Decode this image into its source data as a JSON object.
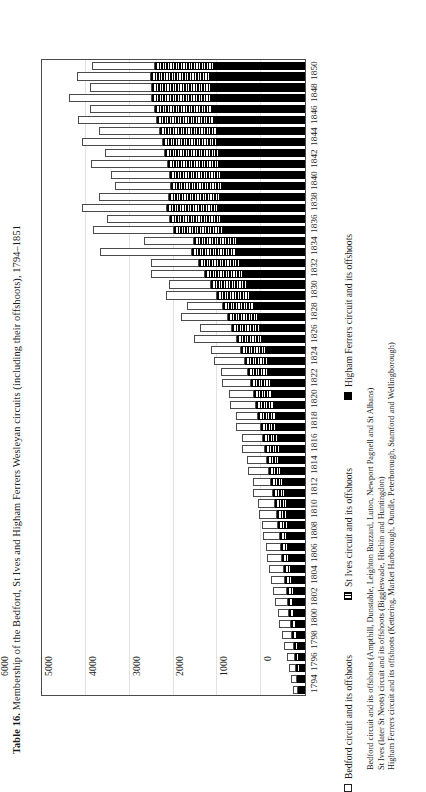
{
  "figure": {
    "table_label": "Table 16.",
    "title": "Membership of the Bedford, St Ives and Higham Ferrers Wesleyan circuits (including their offshoots), 1794–1851"
  },
  "legend": {
    "position": "right",
    "items": [
      {
        "key": "bedford",
        "swatch": "white-square",
        "label": "Bedford circuit and its offshoots"
      },
      {
        "key": "stives",
        "swatch": "hatched-square",
        "label": "St Ives circuit and its offshoots"
      },
      {
        "key": "higham",
        "swatch": "black-square",
        "label": "Higham Ferrers circuit and its offshoots"
      }
    ]
  },
  "footnotes": [
    "Bedford circuit and its offshoots (Ampthill, Dunstable, Leighton Buzzard, Luton, Newport Pagnell and St Albans)",
    "St Ives (later St Neots) circuit and its offshoots (Biggleswade, Hitchin and Huntingdon)",
    "Higham Ferrers circuit and its offshoots (Kettering, Market Harborough, Oundle, Peterborough, Stamford and Wellingborough)"
  ],
  "axis": {
    "value_ticks": [
      "6000",
      "5000",
      "4000",
      "3000",
      "2000",
      "1000",
      "0"
    ],
    "value_min": 0,
    "value_max": 6000,
    "direction": "reversed"
  },
  "chart_data": {
    "type": "bar",
    "orientation": "horizontal",
    "stacked": true,
    "title": "Membership of the Bedford, St Ives and Higham Ferrers Wesleyan circuits (including their offshoots), 1794–1851",
    "xlabel": "",
    "ylabel": "",
    "xlim": [
      0,
      6000
    ],
    "x_axis_reversed": true,
    "grid": true,
    "legend_position": "right",
    "categories": [
      "1851",
      "1850",
      "1849",
      "1848",
      "1847",
      "1846",
      "1845",
      "1844",
      "1843",
      "1842",
      "1841",
      "1840",
      "1839",
      "1838",
      "1837",
      "1836",
      "1835",
      "1834",
      "1833",
      "1832",
      "1831",
      "1830",
      "1829",
      "1828",
      "1827",
      "1826",
      "1825",
      "1824",
      "1823",
      "1822",
      "1821",
      "1820",
      "1819",
      "1818",
      "1817",
      "1816",
      "1815",
      "1814",
      "1813",
      "1812",
      "1811",
      "1810",
      "1809",
      "1808",
      "1807",
      "1806",
      "1805",
      "1804",
      "1803",
      "1802",
      "1801",
      "1800",
      "1799",
      "1798",
      "1797",
      "1796",
      "1795",
      "1794"
    ],
    "tick_labels_shown": [
      "1850",
      "1848",
      "1846",
      "1844",
      "1842",
      "1840",
      "1838",
      "1836",
      "1834",
      "1832",
      "1830",
      "1828",
      "1826",
      "1824",
      "1822",
      "1820",
      "1818",
      "1816",
      "1814",
      "1812",
      "1810",
      "1808",
      "1806",
      "1804",
      "1802",
      "1800",
      "1798",
      "1796",
      "1794"
    ],
    "series": [
      {
        "name": "Higham Ferrers circuit and its offshoots",
        "color": "#000000",
        "pattern": "solid-black",
        "values": [
          2080,
          2130,
          2110,
          2120,
          2090,
          2060,
          2010,
          1980,
          1950,
          1910,
          1890,
          1870,
          1900,
          1930,
          1880,
          1840,
          1560,
          1580,
          1490,
          1400,
          1320,
          1230,
          1150,
          1080,
          1020,
          960,
          900,
          850,
          800,
          760,
          720,
          690,
          660,
          630,
          600,
          570,
          540,
          510,
          480,
          450,
          420,
          400,
          380,
          360,
          340,
          320,
          300,
          280,
          260,
          240,
          220,
          200,
          180,
          160,
          140,
          125,
          110,
          95
        ]
      },
      {
        "name": "St Ives circuit and its offshoots",
        "color": "#000000",
        "pattern": "hatched",
        "values": [
          1350,
          1380,
          1370,
          1360,
          1340,
          1320,
          1290,
          1270,
          1250,
          1220,
          1200,
          1180,
          1200,
          1230,
          1190,
          1160,
          980,
          995,
          940,
          880,
          830,
          770,
          720,
          680,
          640,
          600,
          560,
          530,
          500,
          470,
          445,
          425,
          405,
          385,
          365,
          350,
          330,
          312,
          295,
          278,
          260,
          245,
          232,
          220,
          208,
          196,
          184,
          172,
          160,
          148,
          136,
          124,
          112,
          100,
          88,
          78,
          68,
          58
        ]
      },
      {
        "name": "Bedford circuit and its offshoots",
        "color": "#ffffff",
        "pattern": "open",
        "values": [
          1430,
          1690,
          1430,
          1900,
          1480,
          1790,
          1400,
          1830,
          1370,
          1760,
          1330,
          1280,
          1600,
          1930,
          1440,
          1830,
          1130,
          2100,
          1090,
          1240,
          960,
          1180,
          830,
          1070,
          740,
          980,
          690,
          700,
          620,
          660,
          560,
          600,
          520,
          560,
          480,
          520,
          450,
          480,
          420,
          450,
          390,
          410,
          370,
          390,
          350,
          360,
          330,
          330,
          300,
          300,
          270,
          260,
          230,
          210,
          180,
          160,
          140,
          120
        ]
      }
    ]
  }
}
